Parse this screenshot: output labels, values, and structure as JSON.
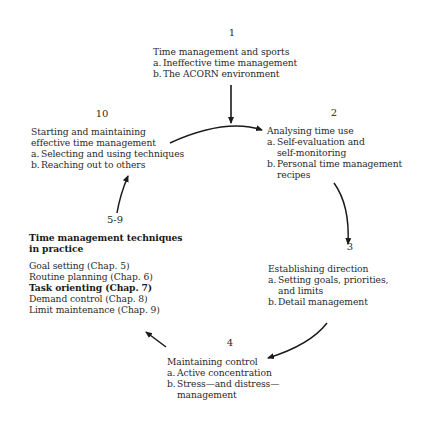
{
  "nodes": {
    "n1": {
      "number": "1",
      "title": "Time management and sports",
      "items": [
        {
          "label": "a.",
          "text": "Ineffective time management"
        },
        {
          "label": "b.",
          "text": "The ACORN environment"
        }
      ]
    },
    "n2": {
      "number": "2",
      "title": "Analysing time use",
      "items": [
        {
          "label": "a.",
          "text": "Self-evaluation and",
          "cont": "self-monitoring"
        },
        {
          "label": "b.",
          "text": "Personal time management",
          "cont": "recipes"
        }
      ]
    },
    "n3": {
      "number": "3",
      "title": "Establishing direction",
      "items": [
        {
          "label": "a.",
          "text": "Setting goals, priorities,",
          "cont": "and limits"
        },
        {
          "label": "b.",
          "text": "Detail management"
        }
      ]
    },
    "n4": {
      "number": "4",
      "title": "Maintaining control",
      "items": [
        {
          "label": "a.",
          "text": "Active concentration"
        },
        {
          "label": "b.",
          "text": "Stress—and distress—",
          "cont": "management"
        }
      ]
    },
    "n59": {
      "number": "5-9",
      "title_line1": "Time management techniques",
      "title_line2": "in practice",
      "techniques": [
        {
          "text": "Goal setting (Chap. 5)",
          "bold": false
        },
        {
          "text": "Routine planning (Chap. 6)",
          "bold": false
        },
        {
          "text": "Task orienting (Chap. 7)",
          "bold": true
        },
        {
          "text": "Demand control (Chap. 8)",
          "bold": false
        },
        {
          "text": "Limit maintenance (Chap. 9)",
          "bold": false
        }
      ]
    },
    "n10": {
      "number": "10",
      "title_line1": "Starting and maintaining",
      "title_line2": "effective time management",
      "items": [
        {
          "label": "a.",
          "text": "Selecting and using techniques"
        },
        {
          "label": "b.",
          "text": "Reaching out to others"
        }
      ]
    }
  },
  "colors": {
    "text": "#2a2a2a",
    "arrow": "#1a1a1a",
    "background": "#ffffff"
  }
}
